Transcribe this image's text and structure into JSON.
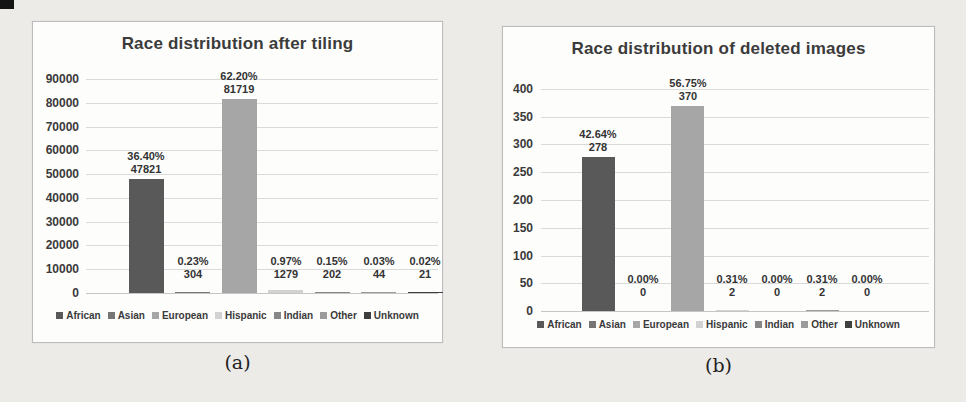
{
  "figure": {
    "background_color": "#ecebe8",
    "panel_color": "#fdfdfc",
    "text_color": "#3b3b3b"
  },
  "chart_data": [
    {
      "type": "bar",
      "title": "Race distribution after tiling",
      "categories": [
        "African",
        "Asian",
        "European",
        "Hispanic",
        "Indian",
        "Other",
        "Unknown"
      ],
      "values": [
        47821,
        304,
        81719,
        1279,
        202,
        44,
        21
      ],
      "percent_labels": [
        "36.40%",
        "0.23%",
        "62.20%",
        "0.97%",
        "0.15%",
        "0.03%",
        "0.02%"
      ],
      "count_labels": [
        "47821",
        "304",
        "81719",
        "1279",
        "202",
        "44",
        "21"
      ],
      "bar_colors": [
        "#595959",
        "#767676",
        "#a6a6a6",
        "#d2d2d2",
        "#878787",
        "#9b9b9b",
        "#3f3f3f"
      ],
      "xlabel": "",
      "ylabel": "",
      "ylim": [
        0,
        90000
      ],
      "ytick_step": 10000,
      "ytick_labels": [
        "0",
        "10000",
        "20000",
        "30000",
        "40000",
        "50000",
        "60000",
        "70000",
        "80000",
        "90000"
      ],
      "grid": true,
      "legend_position": "bottom",
      "caption": "(a)"
    },
    {
      "type": "bar",
      "title": "Race distribution of deleted images",
      "categories": [
        "African",
        "Asian",
        "European",
        "Hispanic",
        "Indian",
        "Other",
        "Unknown"
      ],
      "values": [
        278,
        0,
        370,
        2,
        0,
        2,
        0
      ],
      "percent_labels": [
        "42.64%",
        "0.00%",
        "56.75%",
        "0.31%",
        "0.00%",
        "0.31%",
        "0.00%"
      ],
      "count_labels": [
        "278",
        "0",
        "370",
        "2",
        "0",
        "2",
        "0"
      ],
      "bar_colors": [
        "#595959",
        "#767676",
        "#a6a6a6",
        "#d2d2d2",
        "#878787",
        "#9b9b9b",
        "#3f3f3f"
      ],
      "xlabel": "",
      "ylabel": "",
      "ylim": [
        0,
        400
      ],
      "ytick_step": 50,
      "ytick_labels": [
        "0",
        "50",
        "100",
        "150",
        "200",
        "250",
        "300",
        "350",
        "400"
      ],
      "grid": true,
      "legend_position": "bottom",
      "caption": "(b)"
    }
  ]
}
